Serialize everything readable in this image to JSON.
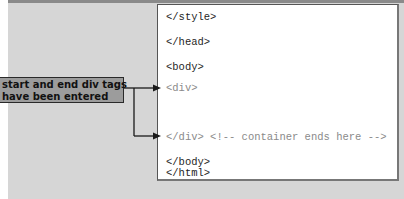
{
  "callout": {
    "line1": "start and end div tags",
    "line2": "have been entered"
  },
  "code": {
    "lines": [
      {
        "text": "</style>",
        "style": "normal"
      },
      {
        "text": "</head>",
        "style": "normal"
      },
      {
        "text": "<body>",
        "style": "normal"
      },
      {
        "text": "<div>",
        "style": "highlight"
      },
      {
        "text": "</div> <!-- container ends here -->",
        "style": "highlight"
      },
      {
        "text": "</body>",
        "style": "normal"
      },
      {
        "text": "</html>",
        "style": "normal"
      }
    ]
  },
  "colors": {
    "background": "#d6d6d6",
    "callout_fill": "#9c9c9c",
    "highlight_text": "#8a8a8a",
    "code_text": "#1f1f1f"
  }
}
